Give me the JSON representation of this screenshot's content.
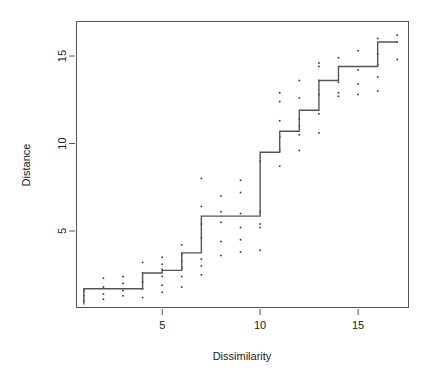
{
  "chart_data": {
    "type": "scatter",
    "title": "",
    "subtitle": "",
    "xlabel": "Dissimilarity",
    "ylabel": "Distance",
    "xlim": [
      0.6,
      17.6
    ],
    "ylim": [
      0.6,
      17.0
    ],
    "xticks": [
      5,
      10,
      15
    ],
    "yticks": [
      5,
      10,
      15
    ],
    "xtick_labels": [
      "5",
      "10",
      "15"
    ],
    "ytick_labels": [
      "5",
      "10",
      "15"
    ],
    "grid": false,
    "legend": null,
    "box": true,
    "point_color": "#303030",
    "line_color": "#555555",
    "series": [
      {
        "name": "observations",
        "type": "scatter",
        "x": [
          1,
          1,
          1,
          2,
          2,
          2,
          2,
          3,
          3,
          3,
          3,
          4,
          4,
          4,
          4,
          4,
          5,
          5,
          5,
          5,
          5,
          5,
          6,
          6,
          6,
          6,
          6,
          6,
          7,
          7,
          7,
          7,
          7,
          7,
          7,
          8,
          8,
          8,
          8,
          8,
          9,
          9,
          9,
          9,
          9,
          9,
          10,
          10,
          10,
          10,
          10,
          11,
          11,
          11,
          11,
          11,
          11,
          12,
          12,
          12,
          12,
          12,
          12,
          13,
          13,
          13,
          13,
          13,
          13,
          14,
          14,
          14,
          14,
          15,
          15,
          15,
          15,
          16,
          16,
          16,
          16,
          16,
          17,
          17,
          17
        ],
        "y": [
          1.0,
          1.3,
          1.6,
          1.1,
          1.4,
          1.8,
          2.3,
          1.3,
          1.6,
          2.0,
          2.4,
          1.2,
          1.7,
          2.1,
          2.6,
          3.2,
          1.5,
          1.9,
          2.4,
          2.8,
          3.1,
          3.5,
          1.8,
          2.4,
          2.9,
          3.3,
          3.7,
          4.2,
          2.5,
          3.0,
          3.4,
          4.6,
          5.4,
          6.4,
          8.0,
          3.6,
          4.4,
          5.5,
          6.1,
          7.0,
          3.8,
          4.5,
          5.2,
          6.0,
          7.2,
          7.9,
          3.9,
          5.2,
          5.4,
          6.1,
          9.0,
          8.7,
          9.6,
          10.4,
          11.3,
          12.4,
          12.9,
          9.6,
          10.5,
          11.0,
          11.4,
          12.6,
          13.6,
          10.6,
          11.7,
          12.8,
          13.6,
          14.4,
          14.6,
          12.7,
          12.9,
          13.5,
          14.9,
          12.8,
          13.4,
          14.2,
          15.3,
          13.0,
          13.8,
          14.5,
          15.1,
          16.0,
          14.8,
          15.8,
          16.2
        ]
      },
      {
        "name": "monotone-step-fit",
        "type": "step",
        "x": [
          1,
          4,
          4,
          5,
          5,
          6,
          6,
          7,
          7,
          10,
          10,
          11,
          11,
          12,
          12,
          13,
          13,
          14,
          14,
          16,
          16,
          17
        ],
        "y": [
          1.7,
          1.7,
          2.6,
          2.6,
          2.75,
          2.75,
          3.75,
          3.75,
          5.85,
          5.85,
          9.5,
          9.5,
          10.7,
          10.7,
          11.9,
          11.9,
          13.6,
          13.6,
          14.4,
          14.4,
          15.8,
          15.8
        ],
        "step_levels": [
          1.7,
          2.6,
          2.75,
          3.75,
          5.85,
          9.5,
          10.7,
          11.9,
          13.6,
          14.4,
          15.8
        ],
        "step_breaks": [
          4,
          5,
          6,
          7,
          10,
          11,
          12,
          13,
          14,
          16
        ],
        "drop_start": {
          "x": 1,
          "y_from": 1.7,
          "y_to": 0.8
        }
      }
    ]
  },
  "figure": {
    "width": 431,
    "height": 386,
    "background": "#ffffff",
    "plot_box": {
      "left": 76,
      "top": 21,
      "right": 409,
      "bottom": 308
    }
  }
}
